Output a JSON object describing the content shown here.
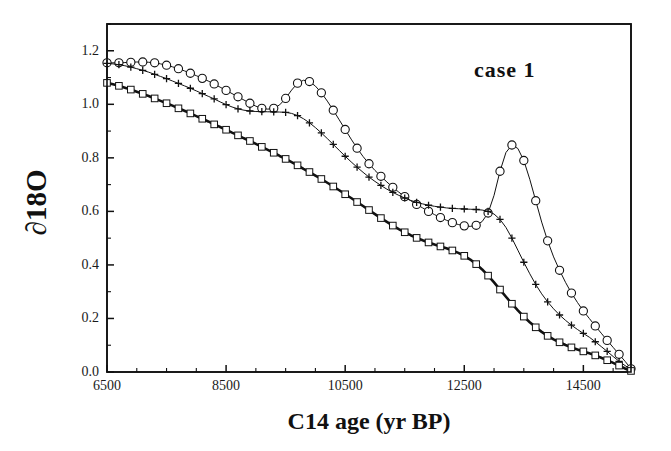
{
  "figure": {
    "annotation": "case  1",
    "background_color": "#ffffff",
    "ink_color": "#111111"
  },
  "chart_data": {
    "type": "line",
    "title": "",
    "subtitle": "",
    "annotations": [
      "case  1"
    ],
    "xlabel": "C14 age (yr BP)",
    "ylabel": "∂ 18O",
    "ylabel_display": "∂18O",
    "xlim": [
      6500,
      15300
    ],
    "ylim": [
      0.0,
      1.3
    ],
    "xticks": [
      6500,
      8500,
      10500,
      12500,
      14500
    ],
    "xtick_labels": [
      "6500",
      "8500",
      "10500",
      "12500",
      "14500"
    ],
    "yticks": [
      0.0,
      0.2,
      0.4,
      0.6,
      0.8,
      1.0,
      1.2
    ],
    "ytick_labels": [
      "0.0",
      "0.2",
      "0.4",
      "0.6",
      "0.8",
      "1.0",
      "1.2"
    ],
    "x_minor_tick_step": 500,
    "y_minor_tick_step": 0.1,
    "grid": false,
    "legend": false,
    "legend_position": "none",
    "frame": "box",
    "x": [
      6500,
      6600,
      6700,
      6800,
      6900,
      7000,
      7100,
      7200,
      7300,
      7400,
      7500,
      7600,
      7700,
      7800,
      7900,
      8000,
      8100,
      8200,
      8300,
      8400,
      8500,
      8600,
      8700,
      8800,
      8900,
      9000,
      9100,
      9200,
      9300,
      9400,
      9500,
      9600,
      9700,
      9800,
      9900,
      10000,
      10100,
      10200,
      10300,
      10400,
      10500,
      10600,
      10700,
      10800,
      10900,
      11000,
      11100,
      11200,
      11300,
      11400,
      11500,
      11600,
      11700,
      11800,
      11900,
      12000,
      12100,
      12200,
      12300,
      12400,
      12500,
      12600,
      12700,
      12800,
      12900,
      13000,
      13100,
      13200,
      13300,
      13400,
      13500,
      13600,
      13700,
      13800,
      13900,
      14000,
      14100,
      14200,
      14300,
      14400,
      14500,
      14600,
      14700,
      14800,
      14900,
      15000,
      15100,
      15200,
      15300
    ],
    "series": [
      {
        "name": "circles",
        "marker": "open-circle",
        "line": "thin",
        "values": [
          1.155,
          1.155,
          1.155,
          1.156,
          1.157,
          1.158,
          1.158,
          1.157,
          1.155,
          1.151,
          1.146,
          1.14,
          1.133,
          1.125,
          1.116,
          1.107,
          1.097,
          1.087,
          1.076,
          1.064,
          1.052,
          1.04,
          1.028,
          1.016,
          1.004,
          0.993,
          0.985,
          0.982,
          0.985,
          0.998,
          1.022,
          1.053,
          1.079,
          1.09,
          1.085,
          1.068,
          1.043,
          1.012,
          0.978,
          0.942,
          0.906,
          0.87,
          0.836,
          0.805,
          0.778,
          0.753,
          0.731,
          0.71,
          0.69,
          0.672,
          0.655,
          0.64,
          0.626,
          0.613,
          0.6,
          0.588,
          0.577,
          0.567,
          0.558,
          0.551,
          0.546,
          0.544,
          0.548,
          0.562,
          0.594,
          0.66,
          0.75,
          0.82,
          0.848,
          0.835,
          0.79,
          0.72,
          0.64,
          0.56,
          0.49,
          0.43,
          0.38,
          0.335,
          0.295,
          0.26,
          0.228,
          0.2,
          0.172,
          0.145,
          0.118,
          0.092,
          0.066,
          0.04,
          0.012
        ]
      },
      {
        "name": "crosses",
        "marker": "plus",
        "line": "thin",
        "values": [
          1.153,
          1.151,
          1.148,
          1.144,
          1.139,
          1.133,
          1.127,
          1.12,
          1.112,
          1.104,
          1.096,
          1.087,
          1.078,
          1.069,
          1.06,
          1.05,
          1.04,
          1.03,
          1.02,
          1.009,
          0.999,
          0.99,
          0.983,
          0.978,
          0.975,
          0.973,
          0.973,
          0.972,
          0.972,
          0.971,
          0.97,
          0.966,
          0.958,
          0.946,
          0.931,
          0.913,
          0.893,
          0.872,
          0.85,
          0.828,
          0.806,
          0.785,
          0.765,
          0.746,
          0.728,
          0.712,
          0.697,
          0.683,
          0.671,
          0.66,
          0.65,
          0.641,
          0.634,
          0.628,
          0.623,
          0.619,
          0.616,
          0.613,
          0.611,
          0.61,
          0.609,
          0.608,
          0.607,
          0.605,
          0.6,
          0.59,
          0.57,
          0.54,
          0.5,
          0.455,
          0.41,
          0.367,
          0.327,
          0.292,
          0.262,
          0.236,
          0.213,
          0.193,
          0.175,
          0.159,
          0.144,
          0.13,
          0.113,
          0.095,
          0.077,
          0.058,
          0.04,
          0.024,
          0.01
        ]
      },
      {
        "name": "squares",
        "marker": "open-square",
        "line": "thick",
        "values": [
          1.08,
          1.075,
          1.069,
          1.062,
          1.055,
          1.047,
          1.039,
          1.031,
          1.022,
          1.013,
          1.004,
          0.995,
          0.985,
          0.976,
          0.966,
          0.956,
          0.946,
          0.936,
          0.925,
          0.915,
          0.905,
          0.894,
          0.884,
          0.873,
          0.863,
          0.852,
          0.841,
          0.83,
          0.819,
          0.807,
          0.796,
          0.784,
          0.772,
          0.759,
          0.747,
          0.734,
          0.721,
          0.707,
          0.693,
          0.679,
          0.664,
          0.65,
          0.635,
          0.62,
          0.605,
          0.59,
          0.575,
          0.561,
          0.547,
          0.534,
          0.522,
          0.511,
          0.501,
          0.492,
          0.484,
          0.476,
          0.469,
          0.462,
          0.454,
          0.445,
          0.434,
          0.42,
          0.403,
          0.383,
          0.36,
          0.335,
          0.308,
          0.281,
          0.255,
          0.23,
          0.207,
          0.186,
          0.167,
          0.15,
          0.135,
          0.122,
          0.111,
          0.101,
          0.092,
          0.084,
          0.077,
          0.07,
          0.062,
          0.053,
          0.044,
          0.034,
          0.024,
          0.013,
          0.004
        ]
      }
    ]
  }
}
